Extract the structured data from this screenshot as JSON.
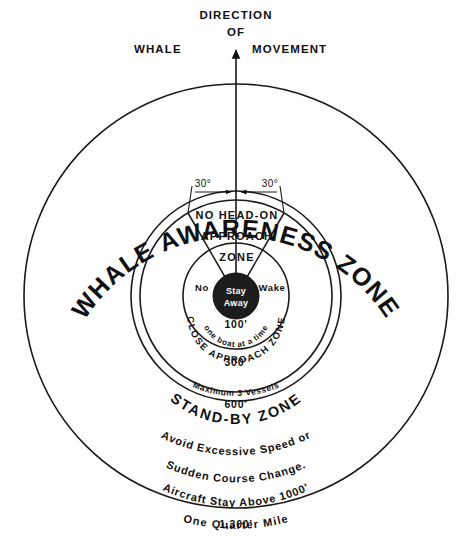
{
  "diagram": {
    "title_top": {
      "line1": "DIRECTION",
      "line2": "OF",
      "line3_left": "WHALE",
      "line3_right": "MOVEMENT"
    },
    "outer_zone": {
      "label_curved": "WHALE  AWARENESS  ZONE",
      "boundary_label": "One Quarter Mile",
      "distance": "1,300'"
    },
    "standby_zone": {
      "label_curved": "STAND-BY ZONE",
      "distance_inner": "300'",
      "distance_outer": "600'",
      "vessel_limit": "Maximum 3 Vessels"
    },
    "no_head_on_zone": {
      "line1": "NO HEAD-ON",
      "line2": "APPROACH",
      "line3": "ZONE",
      "angle_left": "30°",
      "angle_right": "30°"
    },
    "close_approach_zone": {
      "label_curved": "CLOSE APPROACH ZONE",
      "boat_limit_curved": "one boat at a time",
      "distance": "100'",
      "no_label": "No",
      "wake_label": "Wake",
      "center_line1": "Stay",
      "center_line2": "Away"
    },
    "advisories": {
      "line1": "Avoid  Excessive  Speed or",
      "line2": "Sudden  Course  Change.",
      "line3": "Aircraft Stay Above 1000'"
    },
    "colors": {
      "ink": "#111111",
      "paper": "#ffffff",
      "blob": "#1c1c1c"
    }
  }
}
